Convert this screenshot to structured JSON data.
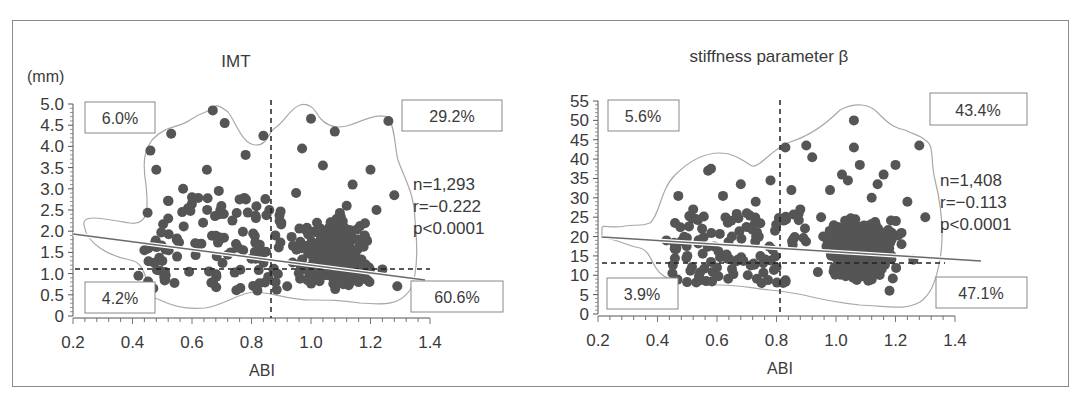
{
  "figure": {
    "panels": [
      {
        "title": "IMT",
        "y_unit": "(mm)",
        "xlabel": "ABI",
        "x_ticks": [
          "0.2",
          "0.4",
          "0.6",
          "0.8",
          "1.0",
          "1.2",
          "1.4"
        ],
        "y_ticks": [
          "0",
          "0.5",
          "1.0",
          "1.5",
          "2.0",
          "2.5",
          "3.0",
          "3.5",
          "4.0",
          "4.5",
          "5.0"
        ],
        "quadrants": {
          "top_left": "6.0%",
          "top_right": "29.2%",
          "bottom_left": "4.2%",
          "bottom_right": "60.6%"
        },
        "stats": {
          "n": "n=1,293",
          "r": "r=−0.222",
          "p": "p<0.0001"
        }
      },
      {
        "title": "stiffness parameter β",
        "y_unit": "",
        "xlabel": "ABI",
        "x_ticks": [
          "0.2",
          "0.4",
          "0.6",
          "0.8",
          "1.0",
          "1.2",
          "1.4"
        ],
        "y_ticks": [
          "0",
          "5",
          "10",
          "15",
          "20",
          "25",
          "30",
          "35",
          "40",
          "45",
          "50",
          "55"
        ],
        "quadrants": {
          "top_left": "5.6%",
          "top_right": "43.4%",
          "bottom_left": "3.9%",
          "bottom_right": "47.1%"
        },
        "stats": {
          "n": "n=1,408",
          "r": "r=−0.113",
          "p": "p<0.0001"
        }
      }
    ],
    "colors": {
      "points": "#555555",
      "contour": "#a0a0a0",
      "regression": "#707070",
      "dashed": "#222222",
      "text": "#3a3a3a"
    }
  },
  "chart_data": [
    {
      "type": "scatter",
      "title": "IMT",
      "xlabel": "ABI",
      "ylabel": "(mm)",
      "xlim": [
        0.2,
        1.4
      ],
      "ylim": [
        0,
        5.0
      ],
      "grid": false,
      "n": 1293,
      "r": -0.222,
      "p": "<0.0001",
      "cutoffs": {
        "x": 0.9,
        "y": 1.1
      },
      "quadrant_percentages": {
        "top_left": 6.0,
        "top_right": 29.2,
        "bottom_left": 4.2,
        "bottom_right": 60.6
      },
      "regression_line": {
        "x": [
          0.2,
          1.4
        ],
        "y": [
          1.92,
          0.85
        ]
      },
      "sample_points": {
        "x": [
          0.42,
          0.44,
          0.46,
          0.47,
          0.48,
          0.5,
          0.52,
          0.53,
          0.55,
          0.57,
          0.6,
          0.62,
          0.65,
          0.67,
          0.69,
          0.71,
          0.73,
          0.76,
          0.78,
          0.8,
          0.82,
          0.84,
          0.86,
          0.88,
          0.9,
          0.92,
          0.95,
          0.97,
          0.98,
          1.0,
          1.02,
          1.04,
          1.06,
          1.08,
          1.1,
          1.12,
          1.14,
          1.16,
          1.18,
          1.2,
          1.22,
          1.24,
          1.26,
          1.28,
          1.29
        ],
        "y": [
          0.95,
          1.55,
          3.9,
          0.65,
          3.45,
          1.3,
          2.3,
          4.3,
          1.4,
          3.0,
          2.8,
          1.7,
          3.45,
          4.85,
          2.95,
          4.55,
          1.5,
          2.75,
          3.8,
          1.35,
          0.6,
          4.25,
          2.5,
          1.9,
          2.2,
          0.7,
          2.9,
          3.95,
          1.1,
          4.65,
          2.2,
          3.55,
          1.6,
          4.35,
          1.2,
          2.6,
          3.1,
          0.8,
          1.9,
          3.45,
          2.5,
          1.1,
          4.6,
          2.85,
          0.7
        ]
      }
    },
    {
      "type": "scatter",
      "title": "stiffness parameter β",
      "xlabel": "ABI",
      "ylabel": "",
      "xlim": [
        0.2,
        1.4
      ],
      "ylim": [
        0,
        55
      ],
      "grid": false,
      "n": 1408,
      "r": -0.113,
      "p": "<0.0001",
      "cutoffs": {
        "x": 0.9,
        "y": 13
      },
      "quadrant_percentages": {
        "top_left": 5.6,
        "top_right": 43.4,
        "bottom_left": 3.9,
        "bottom_right": 47.1
      },
      "regression_line": {
        "x": [
          0.2,
          1.5
        ],
        "y": [
          20,
          13.5
        ]
      },
      "sample_points": {
        "x": [
          0.43,
          0.45,
          0.47,
          0.5,
          0.52,
          0.55,
          0.57,
          0.58,
          0.6,
          0.62,
          0.65,
          0.67,
          0.68,
          0.7,
          0.73,
          0.75,
          0.78,
          0.8,
          0.83,
          0.85,
          0.88,
          0.9,
          0.92,
          0.95,
          0.98,
          1.0,
          1.02,
          1.04,
          1.06,
          1.06,
          1.08,
          1.1,
          1.12,
          1.14,
          1.16,
          1.18,
          1.2,
          1.22,
          1.24,
          1.26,
          1.28,
          1.3
        ],
        "y": [
          19,
          10.5,
          30.5,
          15,
          27,
          22,
          37,
          37.5,
          12,
          30.5,
          20,
          14,
          33.5,
          26,
          29,
          8,
          34.5,
          12,
          43,
          32,
          27,
          43.5,
          40.5,
          25,
          32,
          16,
          36,
          34.5,
          50,
          43,
          38.5,
          22,
          30,
          33.5,
          36,
          6,
          38.5,
          18,
          29,
          14,
          43.5,
          25
        ]
      }
    }
  ]
}
